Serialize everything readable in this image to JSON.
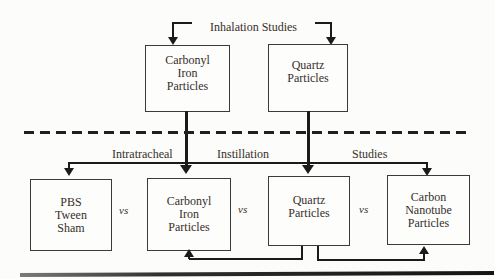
{
  "figure": {
    "background": "#fcfcfa",
    "line_color": "#1b1b1b",
    "text_color": "#362f29",
    "top_label": "Inhalation Studies",
    "mid_labels": {
      "l1": "Intratracheal",
      "l2": "Instillation",
      "l3": "Studies"
    },
    "vs": {
      "v1": "vs",
      "v2": "vs",
      "v3": "vs"
    },
    "top_boxes": {
      "carbonyl_iron": {
        "l1": "Carbonyl",
        "l2": "Iron",
        "l3": "Particles"
      },
      "quartz": {
        "l1": "Quartz",
        "l2": "Particles"
      }
    },
    "bottom_boxes": {
      "pbs": {
        "l1": "PBS",
        "l2": "Tween",
        "l3": "Sham"
      },
      "carbonyl_iron": {
        "l1": "Carbonyl",
        "l2": "Iron",
        "l3": "Particles"
      },
      "quartz": {
        "l1": "Quartz",
        "l2": "Particles"
      },
      "carbon_nanotube": {
        "l1": "Carbon",
        "l2": "Nanotube",
        "l3": "Particles"
      }
    }
  }
}
